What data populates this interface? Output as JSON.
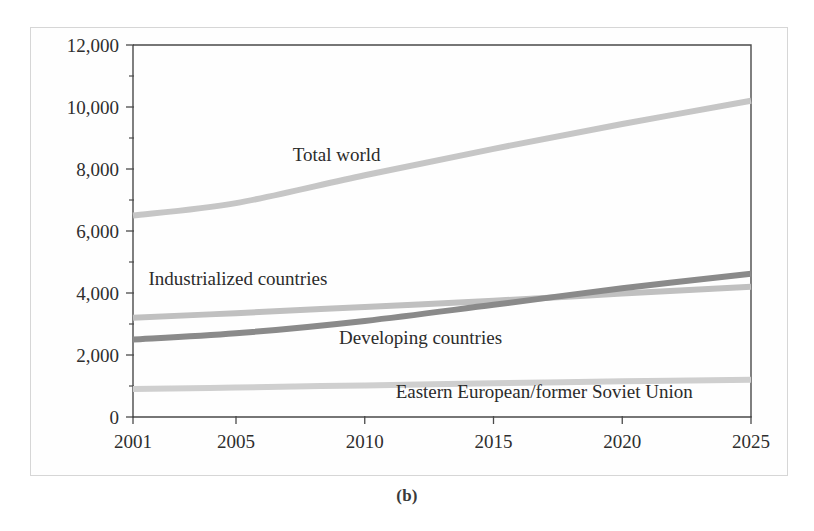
{
  "figure": {
    "caption": "(b)",
    "background_color": "#ffffff",
    "frame_color": "#d6d6d6"
  },
  "chart_data": {
    "type": "line",
    "title": "",
    "subtitle": "",
    "xlabel": "",
    "ylabel": "",
    "xlim": [
      2001,
      2025
    ],
    "ylim": [
      0,
      12000
    ],
    "grid": false,
    "legend_position": "inline-labels",
    "x_tick_labels": [
      "2001",
      "2005",
      "2010",
      "2015",
      "2020",
      "2025"
    ],
    "x_ticks": [
      2001,
      2005,
      2010,
      2015,
      2020,
      2025
    ],
    "y_tick_labels": [
      "0",
      "2,000",
      "4,000",
      "6,000",
      "8,000",
      "10,000",
      "12,000"
    ],
    "y_ticks": [
      0,
      2000,
      4000,
      6000,
      8000,
      10000,
      12000
    ],
    "y_minor_ticks": [
      1000,
      3000,
      5000,
      7000,
      9000,
      11000
    ],
    "x": [
      2001,
      2005,
      2010,
      2015,
      2020,
      2025
    ],
    "series": [
      {
        "name": "Total world",
        "color": "#c6c6c6",
        "values": [
          6500,
          6900,
          7800,
          8650,
          9450,
          10200
        ],
        "label_x": 2007.2,
        "label_y": 8250
      },
      {
        "name": "Industrialized countries",
        "color": "#c0c0c0",
        "values": [
          3200,
          3350,
          3550,
          3750,
          3980,
          4200
        ],
        "label_x": 2001.6,
        "label_y": 4250
      },
      {
        "name": "Developing countries",
        "color": "#8a8a8a",
        "values": [
          2500,
          2700,
          3100,
          3620,
          4150,
          4620
        ],
        "label_x": 2009.0,
        "label_y": 2350
      },
      {
        "name": "Eastern European/former Soviet Union",
        "color": "#cfcfcf",
        "values": [
          900,
          950,
          1020,
          1090,
          1150,
          1200
        ],
        "label_x": 2011.2,
        "label_y": 620
      }
    ]
  }
}
